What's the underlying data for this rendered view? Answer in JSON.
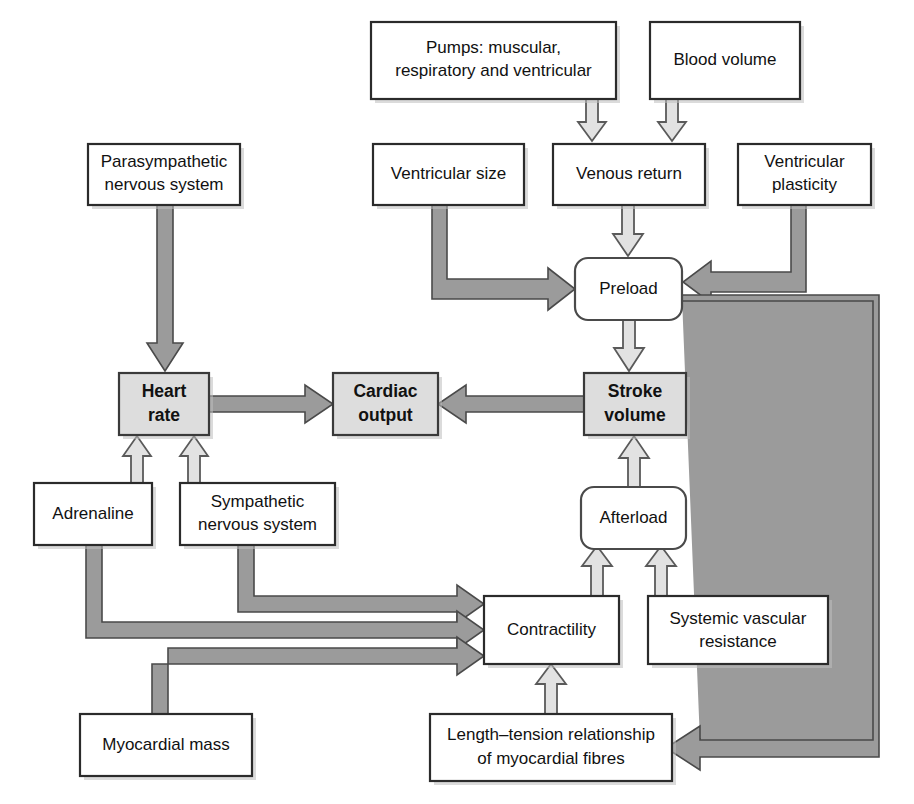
{
  "diagram": {
    "colors": {
      "box_fill": "#ffffff",
      "highlight_fill": "#dddddd",
      "box_stroke": "#2b2b2b",
      "hollow_arrow_fill": "#e2e2e2",
      "solid_arrow_fill": "#9b9b9b",
      "text": "#111111"
    },
    "nodes": [
      {
        "id": "pumps",
        "label_lines": [
          "Pumps: muscular,",
          "respiratory and ventricular"
        ],
        "shape": "rect",
        "emphasis": false,
        "x": 371,
        "y": 22,
        "w": 245,
        "h": 77
      },
      {
        "id": "blood_volume",
        "label_lines": [
          "Blood volume"
        ],
        "shape": "rect",
        "emphasis": false,
        "x": 650,
        "y": 22,
        "w": 150,
        "h": 77
      },
      {
        "id": "parasympathetic",
        "label_lines": [
          "Parasympathetic",
          "nervous system"
        ],
        "shape": "rect",
        "emphasis": false,
        "x": 88,
        "y": 144,
        "w": 152,
        "h": 61
      },
      {
        "id": "ventricular_size",
        "label_lines": [
          "Ventricular size"
        ],
        "shape": "rect",
        "emphasis": false,
        "x": 373,
        "y": 144,
        "w": 151,
        "h": 61
      },
      {
        "id": "venous_return",
        "label_lines": [
          "Venous return"
        ],
        "shape": "rect",
        "emphasis": false,
        "x": 553,
        "y": 144,
        "w": 152,
        "h": 61
      },
      {
        "id": "ventricular_plasticity",
        "label_lines": [
          "Ventricular",
          "plasticity"
        ],
        "shape": "rect",
        "emphasis": false,
        "x": 738,
        "y": 144,
        "w": 133,
        "h": 61
      },
      {
        "id": "preload",
        "label_lines": [
          "Preload"
        ],
        "shape": "rounded-rect",
        "emphasis": false,
        "x": 575,
        "y": 258,
        "w": 107,
        "h": 62
      },
      {
        "id": "heart_rate",
        "label_lines": [
          "Heart",
          "rate"
        ],
        "shape": "rect",
        "emphasis": true,
        "x": 119,
        "y": 373,
        "w": 90,
        "h": 62
      },
      {
        "id": "cardiac_output",
        "label_lines": [
          "Cardiac",
          "output"
        ],
        "shape": "rect",
        "emphasis": true,
        "x": 333,
        "y": 373,
        "w": 105,
        "h": 62
      },
      {
        "id": "stroke_volume",
        "label_lines": [
          "Stroke",
          "volume"
        ],
        "shape": "rect",
        "emphasis": true,
        "x": 584,
        "y": 373,
        "w": 102,
        "h": 62
      },
      {
        "id": "adrenaline",
        "label_lines": [
          "Adrenaline"
        ],
        "shape": "rect",
        "emphasis": false,
        "x": 34,
        "y": 483,
        "w": 118,
        "h": 62
      },
      {
        "id": "sympathetic",
        "label_lines": [
          "Sympathetic",
          "nervous system"
        ],
        "shape": "rect",
        "emphasis": false,
        "x": 180,
        "y": 483,
        "w": 155,
        "h": 62
      },
      {
        "id": "afterload",
        "label_lines": [
          "Afterload"
        ],
        "shape": "rounded-rect",
        "emphasis": false,
        "x": 581,
        "y": 487,
        "w": 105,
        "h": 62
      },
      {
        "id": "contractility",
        "label_lines": [
          "Contractility"
        ],
        "shape": "rect",
        "emphasis": false,
        "x": 484,
        "y": 596,
        "w": 135,
        "h": 68
      },
      {
        "id": "systemic_vascular_resistance",
        "label_lines": [
          "Systemic vascular",
          "resistance"
        ],
        "shape": "rect",
        "emphasis": false,
        "x": 648,
        "y": 596,
        "w": 180,
        "h": 68
      },
      {
        "id": "myocardial_mass",
        "label_lines": [
          "Myocardial mass"
        ],
        "shape": "rect",
        "emphasis": false,
        "x": 80,
        "y": 714,
        "w": 172,
        "h": 62
      },
      {
        "id": "length_tension",
        "label_lines": [
          "Length–tension relationship",
          "of myocardial fibres"
        ],
        "shape": "rect",
        "emphasis": false,
        "x": 430,
        "y": 714,
        "w": 242,
        "h": 67
      }
    ],
    "edges": [
      {
        "from": "pumps",
        "to": "venous_return",
        "style": "hollow"
      },
      {
        "from": "blood_volume",
        "to": "venous_return",
        "style": "hollow"
      },
      {
        "from": "venous_return",
        "to": "preload",
        "style": "hollow"
      },
      {
        "from": "ventricular_size",
        "to": "preload",
        "style": "solid"
      },
      {
        "from": "ventricular_plasticity",
        "to": "preload",
        "style": "solid"
      },
      {
        "from": "parasympathetic",
        "to": "heart_rate",
        "style": "solid"
      },
      {
        "from": "heart_rate",
        "to": "cardiac_output",
        "style": "solid"
      },
      {
        "from": "stroke_volume",
        "to": "cardiac_output",
        "style": "solid"
      },
      {
        "from": "preload",
        "to": "stroke_volume",
        "style": "hollow"
      },
      {
        "from": "adrenaline",
        "to": "heart_rate",
        "style": "hollow"
      },
      {
        "from": "sympathetic",
        "to": "heart_rate",
        "style": "hollow"
      },
      {
        "from": "afterload",
        "to": "stroke_volume",
        "style": "hollow"
      },
      {
        "from": "contractility",
        "to": "afterload",
        "style": "hollow"
      },
      {
        "from": "systemic_vascular_resistance",
        "to": "afterload",
        "style": "hollow"
      },
      {
        "from": "sympathetic",
        "to": "contractility",
        "style": "solid"
      },
      {
        "from": "adrenaline",
        "to": "contractility",
        "style": "solid"
      },
      {
        "from": "myocardial_mass",
        "to": "contractility",
        "style": "solid"
      },
      {
        "from": "length_tension",
        "to": "contractility",
        "style": "hollow"
      },
      {
        "from": "preload",
        "to": "length_tension",
        "style": "solid"
      }
    ]
  }
}
